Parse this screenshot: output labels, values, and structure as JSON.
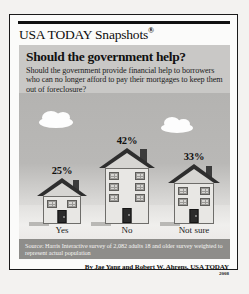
{
  "masthead": {
    "brand": "USA TODAY Snapshots",
    "registered_mark": "®"
  },
  "question": {
    "title": "Should the government help?",
    "subtitle": "Should the government provide financial help to borrowers who can no longer afford to pay their mortgages to keep them out of foreclosure?"
  },
  "footer": {
    "source": "Source: Harris Interactive survey of 2,082 adults 18 and older survey weighted to represent actual population",
    "byline": "By Jae Yang and Robert W. Ahrens, USA TODAY",
    "year": "2008"
  },
  "colors": {
    "frame_border": "#1a1a1a",
    "question_panel": "#c9c8c6",
    "sky": "#b4b3b1",
    "ground": "#efeeec",
    "source_band": "#8e8d8a",
    "house_body": "#e8e7e4",
    "roof_dark": "#2e2e2e",
    "roof_light": "#d6d5d2",
    "door": "#2b2b2b",
    "cloud": "#fdfdfd"
  },
  "icons": {
    "cloud_left": "cloud-icon",
    "cloud_right": "cloud-icon",
    "house_yes": "house-icon",
    "house_no": "house-icon",
    "house_not_sure": "house-icon"
  },
  "chart_data": {
    "type": "bar",
    "title": "Should the government help?",
    "subtitle": "Should the government provide financial help to borrowers who can no longer afford to pay their mortgages to keep them out of foreclosure?",
    "categories": [
      "Yes",
      "No",
      "Not sure"
    ],
    "values": [
      25,
      42,
      33
    ],
    "value_labels": [
      "25%",
      "42%",
      "33%"
    ],
    "xlabel": "",
    "ylabel": "",
    "ylim": [
      0,
      50
    ],
    "units": "percent",
    "grid": false,
    "legend": false,
    "pictogram": "houses sized proportionally to value",
    "source": "Harris Interactive survey of 2,082 adults 18 and older survey weighted to represent actual population"
  }
}
